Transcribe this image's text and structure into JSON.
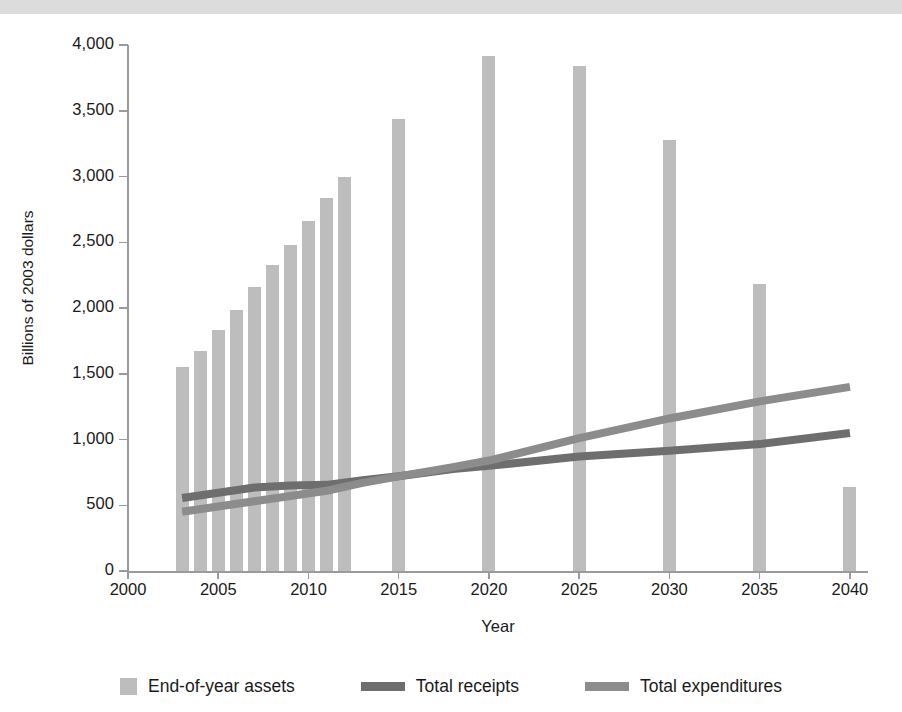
{
  "chart_data": {
    "type": "bar",
    "title": "",
    "xlabel": "Year",
    "ylabel": "Billions of 2003 dollars",
    "xlim": [
      2000,
      2041
    ],
    "ylim": [
      0,
      4000
    ],
    "y_ticks": [
      0,
      500,
      1000,
      1500,
      2000,
      2500,
      3000,
      3500,
      4000
    ],
    "y_tick_labels": [
      "0",
      "500",
      "1,000",
      "1,500",
      "2,000",
      "2,500",
      "3,000",
      "3,500",
      "4,000"
    ],
    "x_ticks": [
      2000,
      2005,
      2010,
      2015,
      2020,
      2025,
      2030,
      2035,
      2040
    ],
    "x_tick_labels": [
      "2000",
      "2005",
      "2010",
      "2015",
      "2020",
      "2025",
      "2030",
      "2035",
      "2040"
    ],
    "grid": false,
    "legend_position": "bottom",
    "series": [
      {
        "name": "End-of-year assets",
        "type": "bar",
        "color": "#bdbdbd",
        "x": [
          2003,
          2004,
          2005,
          2006,
          2007,
          2008,
          2009,
          2010,
          2011,
          2012,
          2015,
          2020,
          2025,
          2030,
          2035,
          2040
        ],
        "values": [
          1550,
          1670,
          1835,
          1985,
          2160,
          2330,
          2480,
          2665,
          2840,
          3000,
          3440,
          3915,
          3840,
          3275,
          2180,
          640
        ]
      },
      {
        "name": "Total receipts",
        "type": "line",
        "color": "#6e6e6e",
        "x": [
          2003,
          2005,
          2007,
          2009,
          2011,
          2013,
          2015,
          2018,
          2020,
          2025,
          2030,
          2035,
          2040
        ],
        "values": [
          555,
          595,
          635,
          650,
          655,
          690,
          720,
          775,
          800,
          870,
          915,
          965,
          1050
        ]
      },
      {
        "name": "Total expenditures",
        "type": "line",
        "color": "#8c8c8c",
        "x": [
          2003,
          2005,
          2007,
          2009,
          2011,
          2013,
          2015,
          2018,
          2020,
          2025,
          2030,
          2035,
          2040
        ],
        "values": [
          450,
          490,
          530,
          570,
          610,
          670,
          720,
          790,
          840,
          1010,
          1160,
          1290,
          1400
        ]
      }
    ]
  },
  "axes": {
    "y_title": "Billions of 2003 dollars",
    "x_title": "Year"
  },
  "legend": {
    "items": [
      {
        "label": "End-of-year assets",
        "marker": "square-swatch",
        "color": "#bdbdbd"
      },
      {
        "label": "Total receipts",
        "marker": "line-swatch",
        "color": "#6e6e6e"
      },
      {
        "label": "Total expenditures",
        "marker": "line-swatch",
        "color": "#8c8c8c"
      }
    ]
  }
}
